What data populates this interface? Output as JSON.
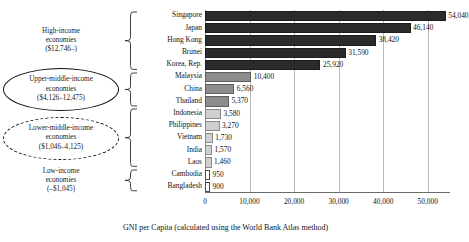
{
  "chart_data": {
    "type": "bar",
    "orientation": "horizontal",
    "title": "",
    "xlabel": "GNI per Capita (calculated using the World Bank Atlas method)",
    "ylabel": "",
    "xlim": [
      0,
      55000
    ],
    "xticks": [
      "0",
      "10,000",
      "20,000",
      "30,000",
      "40,000",
      "50,000"
    ],
    "xtick_values": [
      0,
      10000,
      20000,
      30000,
      40000,
      50000
    ],
    "grid": "vertical",
    "legend": "none",
    "categories": [
      "Singapore",
      "Japan",
      "Hong Kong",
      "Brunei",
      "Korea, Rep.",
      "Malaysia",
      "China",
      "Thailand",
      "Indonesia",
      "Philippines",
      "Vietnam",
      "India",
      "Laos",
      "Cambodia",
      "Bangladesh"
    ],
    "values": [
      54040,
      46140,
      38420,
      31590,
      25920,
      10400,
      6560,
      5370,
      3580,
      3270,
      1730,
      1570,
      1460,
      950,
      900
    ],
    "labels": [
      "54,040",
      "46,140",
      "38,420",
      "31,590",
      "25,920",
      "10,400",
      "6,560",
      "5,370",
      "3,580",
      "3,270",
      "1,730",
      "1,570",
      "1,460",
      "950",
      "900"
    ],
    "bar_shades": [
      "dark",
      "dark",
      "dark",
      "dark",
      "dark",
      "mid",
      "mid",
      "mid",
      "light",
      "light",
      "light",
      "light",
      "light",
      "white",
      "white"
    ]
  },
  "groups": [
    {
      "key": "high-income",
      "line1": "High-income",
      "line2": "economies",
      "line3": "($12,746–)",
      "shape": "none",
      "members": [
        "Singapore",
        "Japan",
        "Hong Kong",
        "Brunei",
        "Korea, Rep."
      ]
    },
    {
      "key": "upper-middle-income",
      "line1": "Upper-middle-income",
      "line2": "economies",
      "line3": "($4,126–12,475)",
      "shape": "ellipse-solid",
      "members": [
        "Malaysia",
        "China",
        "Thailand"
      ]
    },
    {
      "key": "lower-middle-income",
      "line1": "Lower-middle-income",
      "line2": "economies",
      "line3": "($1,046–4,125)",
      "shape": "ellipse-dashed",
      "members": [
        "Indonesia",
        "Philippines",
        "Vietnam",
        "India",
        "Laos"
      ]
    },
    {
      "key": "low-income",
      "line1": "Low-income",
      "line2": "economies",
      "line3": "(–$1,045)",
      "shape": "none",
      "members": [
        "Cambodia",
        "Bangladesh"
      ]
    }
  ],
  "colors": {
    "bar_dark": "#2b2b2b",
    "bar_mid": "#8d8d8d",
    "bar_light": "#cfcfcf",
    "bar_white": "#ffffff",
    "gridline": "#b9b9b9",
    "text": "#141414"
  }
}
